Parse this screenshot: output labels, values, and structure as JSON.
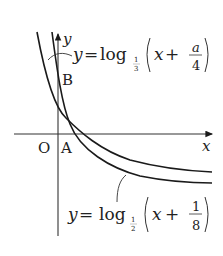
{
  "diagram": {
    "axes": {
      "x_label": "x",
      "y_label": "y",
      "origin_label": "O"
    },
    "points": [
      {
        "label": "A",
        "description": "x-intercept of curves"
      },
      {
        "label": "B",
        "description": "y-intercept of upper-left curve"
      }
    ],
    "curves": [
      {
        "name": "log-third-curve",
        "label_lhs": "y",
        "label_eq": "=",
        "label_fn": "log",
        "base_num": "1",
        "base_den": "3",
        "arg_var": "x",
        "arg_plus": "+",
        "arg_num": "a",
        "arg_den": "4"
      },
      {
        "name": "log-half-curve",
        "label_lhs": "y",
        "label_eq": "=",
        "label_fn": "log",
        "base_num": "1",
        "base_den": "2",
        "arg_var": "x",
        "arg_plus": "+",
        "arg_num": "1",
        "arg_den": "8"
      }
    ],
    "colors": {
      "stroke": "#1a1a1a",
      "background": "#ffffff"
    }
  }
}
